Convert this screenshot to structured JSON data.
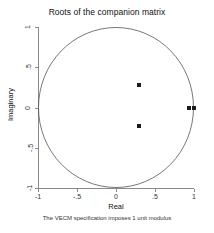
{
  "chart_data": {
    "type": "scatter",
    "title": "Roots of the companion matrix",
    "xlabel": "Real",
    "ylabel": "Imaginary",
    "note": "The VECM specification imposes 1 unit modulus",
    "xlim": [
      -1,
      1
    ],
    "ylim": [
      -1,
      1
    ],
    "grid": false,
    "legend": "none",
    "xticks": [
      -1,
      -0.5,
      0,
      0.5,
      1
    ],
    "xticklabels": [
      "-1",
      "-.5",
      "0",
      ".5",
      "1"
    ],
    "yticks": [
      -1,
      -0.5,
      0,
      0.5,
      1
    ],
    "yticklabels": [
      "-1",
      "-.5",
      "0",
      ".5",
      "1"
    ],
    "reference_shape": {
      "name": "unit-circle",
      "center": [
        0,
        0
      ],
      "radius": 1,
      "stroke": "#555555"
    },
    "points": [
      {
        "real": 0.3,
        "imaginary": 0.28
      },
      {
        "real": 0.3,
        "imaginary": -0.23
      },
      {
        "real": 0.93,
        "imaginary": 0.0
      },
      {
        "real": 1.0,
        "imaginary": 0.0
      }
    ],
    "marker_color": "#1a1a1a"
  }
}
